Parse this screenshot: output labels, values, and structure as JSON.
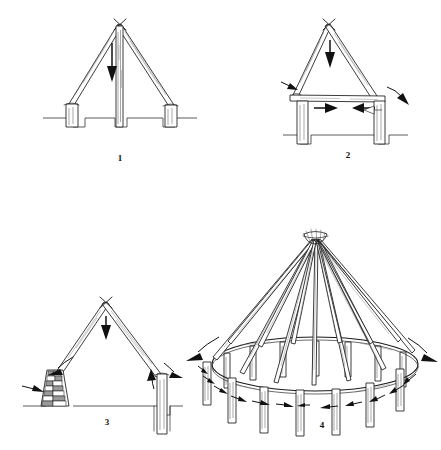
{
  "figure": {
    "background_color": "#ffffff",
    "ink_color": "#1a1a1a",
    "panel_count": 4
  },
  "panels": [
    {
      "id": "panel-1",
      "caption": "1",
      "name": "a-frame-with-ridge-post",
      "stage_label": "1",
      "elements": {
        "rafters": 2,
        "posts": 3,
        "ground_line": true,
        "arrows": [
          {
            "name": "ridge-post-down-arrow",
            "direction": "down",
            "style": "solid"
          }
        ]
      }
    },
    {
      "id": "panel-2",
      "caption": "2",
      "name": "a-frame-with-tie-beam",
      "stage_label": "2",
      "elements": {
        "rafters": 2,
        "posts": 2,
        "tie_beam": true,
        "ground_line": true,
        "arrows": [
          {
            "name": "apex-down-arrow",
            "direction": "down",
            "style": "solid"
          },
          {
            "name": "left-rafter-foot-arrow",
            "direction": "down-right",
            "style": "solid"
          },
          {
            "name": "right-rafter-foot-arrow",
            "direction": "down-right",
            "style": "solid"
          },
          {
            "name": "tie-beam-thrust-arrow-left",
            "direction": "right",
            "style": "solid"
          },
          {
            "name": "tie-beam-thrust-arrow-right",
            "direction": "left",
            "style": "solid"
          },
          {
            "name": "tie-beam-thrust-arrow-outline",
            "direction": "left",
            "style": "outline"
          }
        ]
      }
    },
    {
      "id": "panel-3",
      "caption": "3",
      "name": "a-frame-on-stone-pier-and-post",
      "stage_label": "3",
      "elements": {
        "rafters": 2,
        "stone_pier": true,
        "post": 1,
        "ground_line": true,
        "arrows": [
          {
            "name": "apex-down-arrow",
            "direction": "down",
            "style": "solid"
          },
          {
            "name": "left-rafter-curved-arrow",
            "direction": "down-left",
            "style": "solid"
          },
          {
            "name": "stone-pier-side-arrow",
            "direction": "right",
            "style": "solid"
          },
          {
            "name": "right-post-up-arrow",
            "direction": "up",
            "style": "solid"
          },
          {
            "name": "right-rafter-curved-arrow",
            "direction": "down-right",
            "style": "solid"
          }
        ]
      }
    },
    {
      "id": "panel-4",
      "caption": "4",
      "name": "conical-roof-on-ring-beam",
      "stage_label": "4",
      "elements": {
        "rafters": 12,
        "ring_beam": true,
        "ring_posts": 14,
        "crown_lashing": true,
        "arrows": [
          {
            "name": "ring-spread-arrow-left",
            "direction": "down-left",
            "style": "solid-curved"
          },
          {
            "name": "ring-spread-arrow-right",
            "direction": "down-right",
            "style": "solid-curved"
          },
          {
            "name": "ring-compression-arrows",
            "direction": "inward",
            "style": "solid",
            "count": 12
          }
        ]
      }
    }
  ]
}
